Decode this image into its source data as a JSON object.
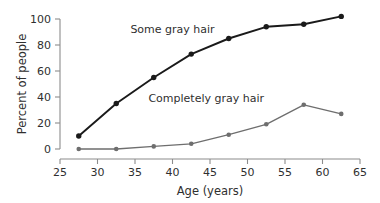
{
  "chart_data": {
    "type": "line",
    "title": "",
    "xlabel": "Age (years)",
    "ylabel": "Percent of people",
    "xlim": [
      25,
      65
    ],
    "ylim": [
      0,
      100
    ],
    "xticks": [
      25,
      30,
      35,
      40,
      45,
      50,
      55,
      60,
      65
    ],
    "yticks": [
      0,
      20,
      40,
      60,
      80,
      100
    ],
    "grid": false,
    "legend_position": "inline-annotation",
    "x": [
      27.5,
      32.5,
      37.5,
      42.5,
      47.5,
      52.5,
      57.5,
      62.5
    ],
    "series": [
      {
        "name": "Some gray hair",
        "color": "#1a1a1a",
        "marker": "filled-circle",
        "values": [
          10,
          35,
          55,
          73,
          85,
          94,
          96,
          102
        ],
        "label_x": 40.0,
        "label_y": 89
      },
      {
        "name": "Completely gray hair",
        "color": "#6e6e6e",
        "marker": "filled-circle",
        "values": [
          0,
          0,
          2,
          4,
          11,
          19,
          34,
          27
        ],
        "label_x": 44.5,
        "label_y": 36
      }
    ]
  },
  "axes": {
    "y_tick_labels": [
      "0",
      "20",
      "40",
      "60",
      "80",
      "100"
    ],
    "x_tick_labels": [
      "25",
      "30",
      "35",
      "40",
      "45",
      "50",
      "55",
      "60",
      "65"
    ],
    "x_axis_title": "Age (years)",
    "y_axis_title": "Percent of people"
  },
  "annotations": {
    "upper_series_label": "Some gray hair",
    "lower_series_label": "Completely gray hair"
  },
  "colors": {
    "background": "#ffffff",
    "axis": "#8c8c8c",
    "text": "#2f2f2f",
    "series_dark": "#1a1a1a",
    "series_gray": "#6e6e6e"
  }
}
